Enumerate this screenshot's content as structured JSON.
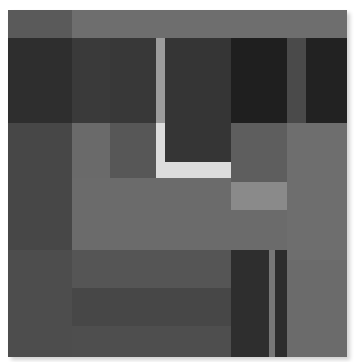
{
  "artwork": {
    "description": "Abstract grayscale composition of overlapping rectangles with a light L-shaped bar",
    "canvas": {
      "x": 8,
      "y": 10,
      "width": 339,
      "height": 347,
      "shadow": true
    },
    "colors": {
      "top_band_left": "#5a5a5a",
      "top_band_right": "#6e6e6e",
      "dark_left": "#2e2e2e",
      "dark_col2": "#3a3a3a",
      "dark_col3": "#383838",
      "light_bar_upper": "#9c9c9c",
      "dark_center": "#353535",
      "darkest_right1": "#1f1f1f",
      "mid_strip_right": "#4a4a4a",
      "darkest_right2": "#222222",
      "mid_left": "#474747",
      "mid_col2": "#6a6a6a",
      "mid_col3": "#575757",
      "l_shape": "#dcdcdc",
      "mid_right_col": "#5e5e5e",
      "light_box": "#8a8a8a",
      "right_column": "#6e6e6e",
      "center_field": "#6b6b6b",
      "low_left": "#4d4d4d",
      "low_band1": "#555555",
      "low_band2": "#474747",
      "low_band3": "#4e4e4e",
      "low_dark1": "#2e2e2e",
      "low_thin_light": "#777777",
      "low_dark2": "#2d2d2d",
      "low_right": "#6b6b6b"
    }
  }
}
